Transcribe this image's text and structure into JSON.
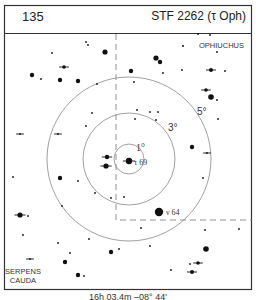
{
  "header": {
    "chart_number": "135",
    "object_name": "STF 2262 (τ Oph)"
  },
  "labels": {
    "constellation_1": "OPHIUCHUS",
    "constellation_2_line1": "SERPENS",
    "constellation_2_line2": "CAUDA",
    "ring_1": "1°",
    "ring_3": "3°",
    "ring_5": "5°",
    "target_star": "τ 69",
    "nearby_star": "ν 64"
  },
  "footer": {
    "coordinates": "16h 03.4m  –08° 44'"
  },
  "chart_data": {
    "type": "scatter",
    "title": "STF 2262 (τ Oph)",
    "chart_number": "135",
    "center": {
      "x": 129,
      "y": 159
    },
    "rings_deg": [
      1,
      3,
      5
    ],
    "ring_radii_px": [
      15,
      46,
      82
    ],
    "constellation_boundary": [
      [
        116,
        34
      ],
      [
        116,
        220
      ],
      [
        252,
        220
      ]
    ],
    "stars": [
      {
        "x": 129,
        "y": 161,
        "r": 3.2,
        "label": "τ 69",
        "double": true
      },
      {
        "x": 159,
        "y": 212,
        "r": 4.2,
        "label": "ν 64"
      },
      {
        "x": 107,
        "y": 157,
        "r": 2.2,
        "double": true
      },
      {
        "x": 106,
        "y": 166,
        "r": 2.6,
        "double": true
      },
      {
        "x": 105,
        "y": 52,
        "r": 2.6
      },
      {
        "x": 64,
        "y": 67,
        "r": 1.8,
        "double": true
      },
      {
        "x": 32,
        "y": 75,
        "r": 2.2
      },
      {
        "x": 60,
        "y": 80,
        "r": 2.2
      },
      {
        "x": 78,
        "y": 81,
        "r": 2.2
      },
      {
        "x": 86,
        "y": 42,
        "r": 0.9
      },
      {
        "x": 88,
        "y": 45,
        "r": 0.9
      },
      {
        "x": 52,
        "y": 53,
        "r": 0.9
      },
      {
        "x": 41,
        "y": 79,
        "r": 0.9
      },
      {
        "x": 156,
        "y": 58,
        "r": 2.6
      },
      {
        "x": 160,
        "y": 62,
        "r": 2.2
      },
      {
        "x": 131,
        "y": 71,
        "r": 2.2
      },
      {
        "x": 183,
        "y": 46,
        "r": 1
      },
      {
        "x": 163,
        "y": 73,
        "r": 0.9
      },
      {
        "x": 182,
        "y": 70,
        "r": 0.9
      },
      {
        "x": 210,
        "y": 35,
        "r": 0.9
      },
      {
        "x": 217,
        "y": 52,
        "r": 0.9
      },
      {
        "x": 211,
        "y": 70,
        "r": 2,
        "double": true
      },
      {
        "x": 225,
        "y": 71,
        "r": 0.9
      },
      {
        "x": 206,
        "y": 90,
        "r": 1.8,
        "double": true
      },
      {
        "x": 211,
        "y": 97,
        "r": 2.8
      },
      {
        "x": 217,
        "y": 100,
        "r": 0.9
      },
      {
        "x": 218,
        "y": 119,
        "r": 0.9
      },
      {
        "x": 198,
        "y": 34,
        "r": 0.9
      },
      {
        "x": 134,
        "y": 82,
        "r": 0.9
      },
      {
        "x": 158,
        "y": 112,
        "r": 0.9
      },
      {
        "x": 150,
        "y": 112,
        "r": 0.9
      },
      {
        "x": 137,
        "y": 110,
        "r": 0.9
      },
      {
        "x": 135,
        "y": 119,
        "r": 0.9
      },
      {
        "x": 97,
        "y": 84,
        "r": 0.9
      },
      {
        "x": 92,
        "y": 113,
        "r": 0.9
      },
      {
        "x": 86,
        "y": 126,
        "r": 0.9
      },
      {
        "x": 58,
        "y": 134,
        "r": 0.9,
        "double": true
      },
      {
        "x": 20,
        "y": 134,
        "r": 0.9,
        "double": true
      },
      {
        "x": 156,
        "y": 120,
        "r": 0.9
      },
      {
        "x": 192,
        "y": 147,
        "r": 2.2
      },
      {
        "x": 207,
        "y": 153,
        "r": 0.9,
        "double": true
      },
      {
        "x": 203,
        "y": 178,
        "r": 0.9
      },
      {
        "x": 60,
        "y": 178,
        "r": 2.2
      },
      {
        "x": 78,
        "y": 181,
        "r": 0.9
      },
      {
        "x": 13,
        "y": 177,
        "r": 0.9
      },
      {
        "x": 95,
        "y": 193,
        "r": 0.9
      },
      {
        "x": 111,
        "y": 198,
        "r": 0.9
      },
      {
        "x": 124,
        "y": 197,
        "r": 0.9
      },
      {
        "x": 20,
        "y": 215,
        "r": 2.6,
        "double": true
      },
      {
        "x": 28,
        "y": 216,
        "r": 0.9
      },
      {
        "x": 62,
        "y": 206,
        "r": 0.9
      },
      {
        "x": 141,
        "y": 228,
        "r": 0.9
      },
      {
        "x": 205,
        "y": 230,
        "r": 0.9
      },
      {
        "x": 239,
        "y": 229,
        "r": 0.9
      },
      {
        "x": 206,
        "y": 249,
        "r": 2.8
      },
      {
        "x": 198,
        "y": 263,
        "r": 1.8,
        "double": true
      },
      {
        "x": 192,
        "y": 272,
        "r": 2,
        "double": true
      },
      {
        "x": 171,
        "y": 270,
        "r": 0.9
      },
      {
        "x": 23,
        "y": 235,
        "r": 0.9
      },
      {
        "x": 58,
        "y": 243,
        "r": 0.9
      },
      {
        "x": 70,
        "y": 253,
        "r": 0.9
      },
      {
        "x": 89,
        "y": 239,
        "r": 0.9
      },
      {
        "x": 111,
        "y": 252,
        "r": 2.2
      },
      {
        "x": 119,
        "y": 249,
        "r": 0.9
      },
      {
        "x": 65,
        "y": 262,
        "r": 2.2
      },
      {
        "x": 30,
        "y": 259,
        "r": 0.9,
        "double": true
      },
      {
        "x": 78,
        "y": 275,
        "r": 2.2
      },
      {
        "x": 84,
        "y": 276,
        "r": 0.9
      },
      {
        "x": 190,
        "y": 264,
        "r": 0.9
      },
      {
        "x": 150,
        "y": 246,
        "r": 0.9
      }
    ]
  }
}
